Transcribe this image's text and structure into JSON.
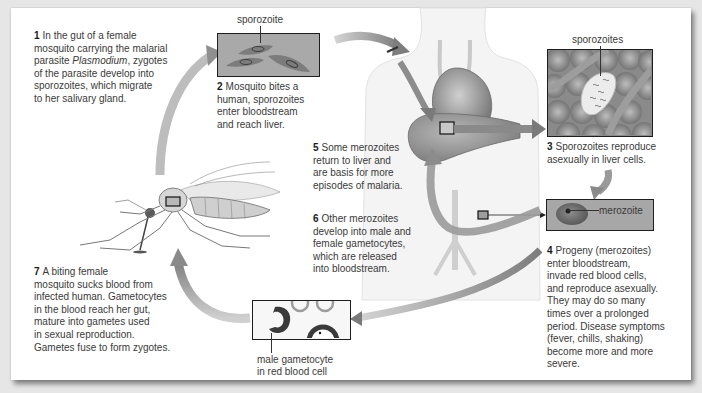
{
  "diagram": {
    "colors": {
      "background": "#e6e6e6",
      "panel": "#ffffff",
      "arrow": "#8a8a8a",
      "text": "#3a3a3a",
      "box_border": "#1e1e1e",
      "micro_fill": "#a9a9a9"
    },
    "steps": [
      {
        "number": "1",
        "text_before": "In the gut of a female\nmosquito carrying the malarial\nparasite ",
        "italic": "Plasmodium",
        "text_after": ", zygotes\nof the parasite develop into\nsporozoites, which migrate\nto her salivary gland."
      },
      {
        "number": "2",
        "text": "Mosquito bites a\nhuman, sporozoites\nenter bloodstream\nand reach liver."
      },
      {
        "number": "3",
        "text": "Sporozoites reproduce\nasexually in liver cells."
      },
      {
        "number": "4",
        "text": "Progeny (merozoites)\nenter bloodstream,\ninvade red blood cells,\nand reproduce asexually.\nThey may do so many\ntimes over a prolonged\nperiod. Disease symptoms\n(fever, chills, shaking)\nbecome more and more\nsevere."
      },
      {
        "number": "5",
        "text": "Some merozoites\nreturn to liver and\nare basis for more\nepisodes of malaria."
      },
      {
        "number": "6",
        "text": "Other merozoites\ndevelop into male and\nfemale gametocytes,\nwhich are released\ninto bloodstream."
      },
      {
        "number": "7",
        "text": "A biting female\nmosquito sucks blood from\ninfected human. Gametocytes\nin the blood reach her gut,\nmature into gametes used\nin sexual reproduction.\nGametes fuse to form zygotes."
      }
    ],
    "labels": {
      "sporozoite": "sporozoite",
      "sporozoites": "sporozoites",
      "merozoite": "merozoite",
      "gametocyte": "male gametocyte\nin red blood cell"
    },
    "illustrations": {
      "mosquito": "mosquito-illustration",
      "human": "human-torso-illustration",
      "liver": "liver",
      "heart": "heart"
    }
  }
}
